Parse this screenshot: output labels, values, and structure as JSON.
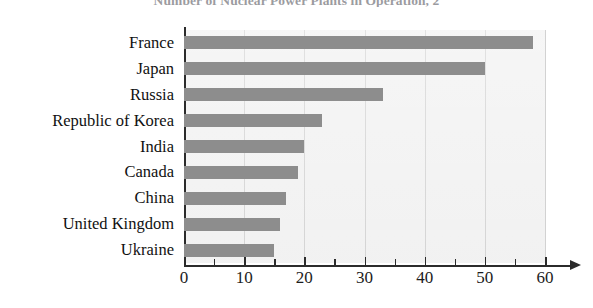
{
  "chart_data": {
    "type": "bar",
    "orientation": "horizontal",
    "title": "Number of Nuclear Power Plants in Operation, 2",
    "xlabel": "",
    "ylabel": "",
    "categories": [
      "France",
      "Japan",
      "Russia",
      "Republic of Korea",
      "India",
      "Canada",
      "China",
      "United Kingdom",
      "Ukraine"
    ],
    "values": [
      58,
      50,
      33,
      23,
      20,
      19,
      17,
      16,
      15
    ],
    "xlim": [
      0,
      60
    ],
    "xticks": [
      0,
      10,
      20,
      30,
      40,
      50,
      60
    ],
    "xtick_labels": [
      "0",
      "10",
      "20",
      "30",
      "40",
      "50",
      "60"
    ],
    "minor_tick_step": 5,
    "grid": "vertical-only",
    "legend": "none",
    "bar_color": "#8d8d8d",
    "plot_background": "#f1f1f1",
    "axis_color": "#2b2b2b",
    "gridline_color": "#d2d2d2"
  }
}
